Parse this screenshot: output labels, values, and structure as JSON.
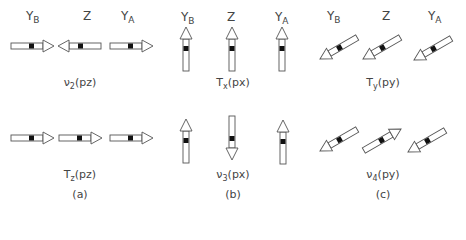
{
  "panels": [
    {
      "id": "a",
      "panel_label": "(a)",
      "atoms": [
        {
          "name": "Y",
          "sub": "B"
        },
        {
          "name": "Z",
          "sub": ""
        },
        {
          "name": "Y",
          "sub": "A"
        }
      ],
      "modes": [
        {
          "symbol": "ν",
          "sub": "2",
          "coord": "(pz)",
          "directions": [
            "right",
            "left",
            "right"
          ]
        },
        {
          "symbol": "T",
          "sub": "z",
          "coord": "(pz)",
          "directions": [
            "right",
            "right",
            "right"
          ]
        }
      ]
    },
    {
      "id": "b",
      "panel_label": "(b)",
      "atoms": [
        {
          "name": "Y",
          "sub": "B"
        },
        {
          "name": "Z",
          "sub": ""
        },
        {
          "name": "Y",
          "sub": "A"
        }
      ],
      "modes": [
        {
          "symbol": "T",
          "sub": "x",
          "coord": "(px)",
          "directions": [
            "up",
            "up",
            "up"
          ]
        },
        {
          "symbol": "ν",
          "sub": "3",
          "coord": "(px)",
          "directions": [
            "up",
            "down",
            "up"
          ]
        }
      ]
    },
    {
      "id": "c",
      "panel_label": "(c)",
      "atoms": [
        {
          "name": "Y",
          "sub": "B"
        },
        {
          "name": "Z",
          "sub": ""
        },
        {
          "name": "Y",
          "sub": "A"
        }
      ],
      "modes": [
        {
          "symbol": "T",
          "sub": "y",
          "coord": "(py)",
          "directions": [
            "down-left",
            "down-left",
            "down-left"
          ]
        },
        {
          "symbol": "ν",
          "sub": "4",
          "coord": "(py)",
          "directions": [
            "down-left",
            "up-right",
            "down-left"
          ]
        }
      ]
    }
  ]
}
